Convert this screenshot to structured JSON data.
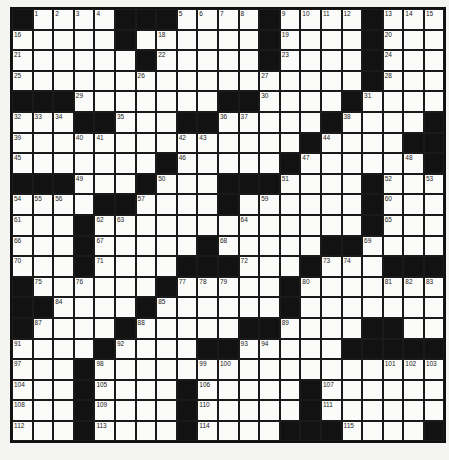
{
  "puzzle": {
    "rows": 21,
    "cols": 21,
    "colors": {
      "black": "#121212",
      "white": "#fbfbf9",
      "line": "#1a1a1a"
    },
    "grid": [
      "#....###....#....#...",
      ".....#......#....#...",
      "......#.....#....#...",
      ".................#...",
      "###.......##....#....",
      "...##...##.....#....#",
      "..............#....##",
      ".......#.....#......#",
      "###...#...###....#...",
      "....##....#......#...",
      "...#.............#...",
      "...#.....#.....##....",
      "...#....###...#...###",
      "#......#.....#.......",
      "##....#......#.......",
      "#....#.....##....##..",
      "....#....##.....#####",
      "...#.................",
      "...#....#.....#......",
      "...#....#.....#......",
      "...#....#....###....#"
    ],
    "numbers": [
      {
        "r": 0,
        "c": 1,
        "n": 1
      },
      {
        "r": 0,
        "c": 2,
        "n": 2
      },
      {
        "r": 0,
        "c": 3,
        "n": 3
      },
      {
        "r": 0,
        "c": 4,
        "n": 4
      },
      {
        "r": 0,
        "c": 8,
        "n": 5
      },
      {
        "r": 0,
        "c": 9,
        "n": 6
      },
      {
        "r": 0,
        "c": 10,
        "n": 7
      },
      {
        "r": 0,
        "c": 11,
        "n": 8
      },
      {
        "r": 0,
        "c": 13,
        "n": 9
      },
      {
        "r": 0,
        "c": 14,
        "n": 10
      },
      {
        "r": 0,
        "c": 15,
        "n": 11
      },
      {
        "r": 0,
        "c": 16,
        "n": 12
      },
      {
        "r": 0,
        "c": 18,
        "n": 13
      },
      {
        "r": 0,
        "c": 19,
        "n": 14
      },
      {
        "r": 0,
        "c": 20,
        "n": 15
      },
      {
        "r": 1,
        "c": 0,
        "n": 16
      },
      {
        "r": 1,
        "c": 5,
        "n": 17
      },
      {
        "r": 1,
        "c": 7,
        "n": 18
      },
      {
        "r": 1,
        "c": 13,
        "n": 19
      },
      {
        "r": 1,
        "c": 18,
        "n": 20
      },
      {
        "r": 2,
        "c": 0,
        "n": 21
      },
      {
        "r": 2,
        "c": 7,
        "n": 22
      },
      {
        "r": 2,
        "c": 13,
        "n": 23
      },
      {
        "r": 2,
        "c": 18,
        "n": 24
      },
      {
        "r": 3,
        "c": 0,
        "n": 25
      },
      {
        "r": 3,
        "c": 6,
        "n": 26
      },
      {
        "r": 3,
        "c": 12,
        "n": 27
      },
      {
        "r": 3,
        "c": 18,
        "n": 28
      },
      {
        "r": 4,
        "c": 3,
        "n": 29
      },
      {
        "r": 4,
        "c": 12,
        "n": 30
      },
      {
        "r": 4,
        "c": 17,
        "n": 31
      },
      {
        "r": 5,
        "c": 0,
        "n": 32
      },
      {
        "r": 5,
        "c": 1,
        "n": 33
      },
      {
        "r": 5,
        "c": 2,
        "n": 34
      },
      {
        "r": 5,
        "c": 5,
        "n": 35
      },
      {
        "r": 5,
        "c": 10,
        "n": 36
      },
      {
        "r": 5,
        "c": 11,
        "n": 37
      },
      {
        "r": 5,
        "c": 16,
        "n": 38
      },
      {
        "r": 6,
        "c": 0,
        "n": 39
      },
      {
        "r": 6,
        "c": 3,
        "n": 40
      },
      {
        "r": 6,
        "c": 4,
        "n": 41
      },
      {
        "r": 6,
        "c": 8,
        "n": 42
      },
      {
        "r": 6,
        "c": 9,
        "n": 43
      },
      {
        "r": 6,
        "c": 15,
        "n": 44
      },
      {
        "r": 7,
        "c": 0,
        "n": 45
      },
      {
        "r": 7,
        "c": 8,
        "n": 46
      },
      {
        "r": 7,
        "c": 14,
        "n": 47
      },
      {
        "r": 7,
        "c": 19,
        "n": 48
      },
      {
        "r": 8,
        "c": 3,
        "n": 49
      },
      {
        "r": 8,
        "c": 7,
        "n": 50
      },
      {
        "r": 8,
        "c": 13,
        "n": 51
      },
      {
        "r": 8,
        "c": 18,
        "n": 52
      },
      {
        "r": 8,
        "c": 20,
        "n": 53
      },
      {
        "r": 9,
        "c": 0,
        "n": 54
      },
      {
        "r": 9,
        "c": 1,
        "n": 55
      },
      {
        "r": 9,
        "c": 2,
        "n": 56
      },
      {
        "r": 9,
        "c": 6,
        "n": 57
      },
      {
        "r": 9,
        "c": 10,
        "n": 58
      },
      {
        "r": 9,
        "c": 12,
        "n": 59
      },
      {
        "r": 9,
        "c": 18,
        "n": 60
      },
      {
        "r": 10,
        "c": 0,
        "n": 61
      },
      {
        "r": 10,
        "c": 4,
        "n": 62
      },
      {
        "r": 10,
        "c": 5,
        "n": 63
      },
      {
        "r": 10,
        "c": 11,
        "n": 64
      },
      {
        "r": 10,
        "c": 18,
        "n": 65
      },
      {
        "r": 11,
        "c": 0,
        "n": 66
      },
      {
        "r": 11,
        "c": 4,
        "n": 67
      },
      {
        "r": 11,
        "c": 10,
        "n": 68
      },
      {
        "r": 11,
        "c": 17,
        "n": 69
      },
      {
        "r": 12,
        "c": 0,
        "n": 70
      },
      {
        "r": 12,
        "c": 4,
        "n": 71
      },
      {
        "r": 12,
        "c": 11,
        "n": 72
      },
      {
        "r": 12,
        "c": 15,
        "n": 73
      },
      {
        "r": 12,
        "c": 16,
        "n": 74
      },
      {
        "r": 13,
        "c": 1,
        "n": 75
      },
      {
        "r": 13,
        "c": 3,
        "n": 76
      },
      {
        "r": 13,
        "c": 8,
        "n": 77
      },
      {
        "r": 13,
        "c": 9,
        "n": 78
      },
      {
        "r": 13,
        "c": 10,
        "n": 79
      },
      {
        "r": 13,
        "c": 14,
        "n": 80
      },
      {
        "r": 13,
        "c": 18,
        "n": 81
      },
      {
        "r": 13,
        "c": 19,
        "n": 82
      },
      {
        "r": 13,
        "c": 20,
        "n": 83
      },
      {
        "r": 14,
        "c": 2,
        "n": 84
      },
      {
        "r": 14,
        "c": 7,
        "n": 85
      },
      {
        "r": 14,
        "c": 13,
        "n": 86
      },
      {
        "r": 15,
        "c": 1,
        "n": 87
      },
      {
        "r": 15,
        "c": 6,
        "n": 88
      },
      {
        "r": 15,
        "c": 13,
        "n": 89
      },
      {
        "r": 15,
        "c": 18,
        "n": 90
      },
      {
        "r": 16,
        "c": 0,
        "n": 91
      },
      {
        "r": 16,
        "c": 5,
        "n": 92
      },
      {
        "r": 16,
        "c": 11,
        "n": 93
      },
      {
        "r": 16,
        "c": 12,
        "n": 94
      },
      {
        "r": 16,
        "c": 16,
        "n": 95
      },
      {
        "r": 16,
        "c": 17,
        "n": 96
      },
      {
        "r": 17,
        "c": 0,
        "n": 97
      },
      {
        "r": 17,
        "c": 4,
        "n": 98
      },
      {
        "r": 17,
        "c": 9,
        "n": 99
      },
      {
        "r": 17,
        "c": 10,
        "n": 100
      },
      {
        "r": 17,
        "c": 18,
        "n": 101
      },
      {
        "r": 17,
        "c": 19,
        "n": 102
      },
      {
        "r": 17,
        "c": 20,
        "n": 103
      },
      {
        "r": 18,
        "c": 0,
        "n": 104
      },
      {
        "r": 18,
        "c": 4,
        "n": 105
      },
      {
        "r": 18,
        "c": 9,
        "n": 106
      },
      {
        "r": 18,
        "c": 15,
        "n": 107
      },
      {
        "r": 19,
        "c": 0,
        "n": 108
      },
      {
        "r": 19,
        "c": 4,
        "n": 109
      },
      {
        "r": 19,
        "c": 9,
        "n": 110
      },
      {
        "r": 19,
        "c": 15,
        "n": 111
      },
      {
        "r": 20,
        "c": 0,
        "n": 112
      },
      {
        "r": 20,
        "c": 4,
        "n": 113
      },
      {
        "r": 20,
        "c": 9,
        "n": 114
      },
      {
        "r": 20,
        "c": 16,
        "n": 115
      }
    ]
  }
}
